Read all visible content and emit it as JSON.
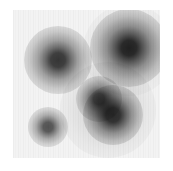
{
  "image": {
    "title": "grayscale density field",
    "canvas_width": 173,
    "canvas_height": 171,
    "background_color": "#ffffff",
    "field_color": "#f3f3f3",
    "texture": "vertical-stripe-noise",
    "colormap": "greys"
  },
  "plot_area": {
    "x": 13,
    "y": 10,
    "width": 147,
    "height": 148
  },
  "chart_data": {
    "type": "heatmap",
    "title": "",
    "xlabel": "",
    "ylabel": "",
    "grid": false,
    "legend": "none",
    "xlim": [
      0,
      147
    ],
    "ylim": [
      0,
      148
    ],
    "colormap": "greys",
    "background_value": 0.05,
    "peaks": [
      {
        "id": "peak-upper-left",
        "cx": 45,
        "cy": 50,
        "radius": 34,
        "core_radius": 9,
        "core_color": "#3c3c3c",
        "mid_color": "#9a9a9a",
        "intensity": 0.78
      },
      {
        "id": "peak-upper-right",
        "cx": 116,
        "cy": 38,
        "radius": 39,
        "core_radius": 10,
        "core_color": "#333333",
        "mid_color": "#959595",
        "intensity": 0.85
      },
      {
        "id": "peak-center-small",
        "cx": 86,
        "cy": 89,
        "radius": 23,
        "core_radius": 7,
        "core_color": "#4a4a4a",
        "mid_color": "#a2a2a2",
        "intensity": 0.7
      },
      {
        "id": "peak-lower-right",
        "cx": 100,
        "cy": 105,
        "radius": 30,
        "core_radius": 9,
        "core_color": "#3a3a3a",
        "mid_color": "#9a9a9a",
        "intensity": 0.8
      },
      {
        "id": "peak-lower-left",
        "cx": 35,
        "cy": 117,
        "radius": 20,
        "core_radius": 6,
        "core_color": "#4d4d4d",
        "mid_color": "#a6a6a6",
        "intensity": 0.66
      }
    ],
    "halos": [
      {
        "id": "halo-lower-cluster",
        "cx": 95,
        "cy": 100,
        "radius": 48,
        "intensity": 0.16
      },
      {
        "id": "halo-upper-right",
        "cx": 116,
        "cy": 40,
        "radius": 46,
        "intensity": 0.12
      }
    ]
  }
}
